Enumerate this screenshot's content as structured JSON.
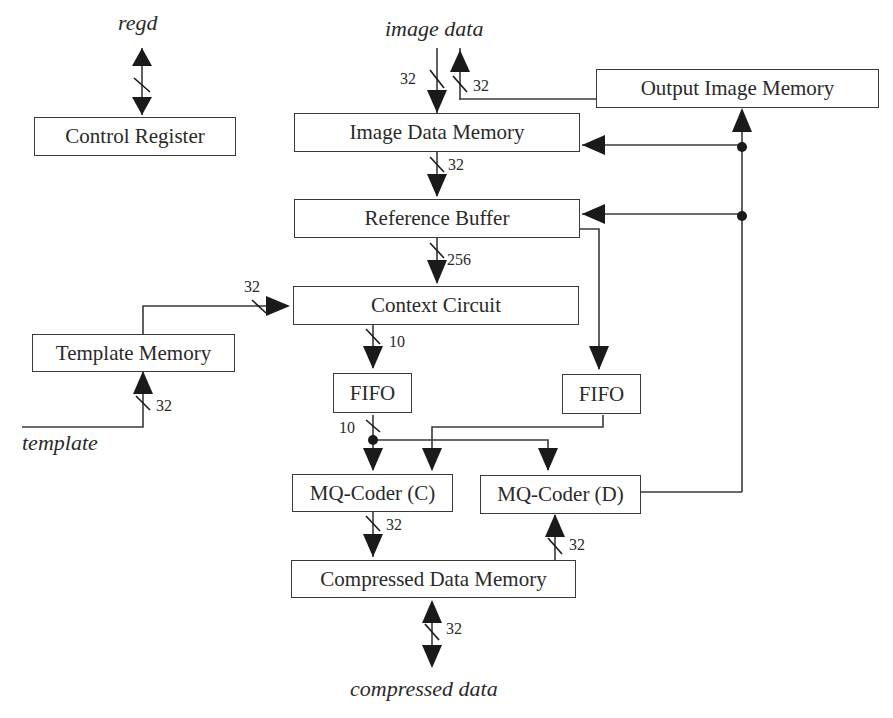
{
  "diagram": {
    "type": "block-diagram",
    "blocks": {
      "control_register": "Control Register",
      "image_data_memory": "Image Data Memory",
      "output_image_memory": "Output Image Memory",
      "reference_buffer": "Reference Buffer",
      "context_circuit": "Context Circuit",
      "template_memory": "Template Memory",
      "fifo_left": "FIFO",
      "fifo_right": "FIFO",
      "mq_coder_c": "MQ-Coder (C)",
      "mq_coder_d": "MQ-Coder (D)",
      "compressed_data_memory": "Compressed Data Memory"
    },
    "io": {
      "regd": "regd",
      "image_data": "image data",
      "template": "template",
      "compressed_data": "compressed data"
    },
    "bus_widths": {
      "image_in": "32",
      "image_out": "32",
      "idm_to_rb": "32",
      "rb_to_cc": "256",
      "tm_to_cc": "32",
      "cc_to_fifo": "10",
      "template_in": "32",
      "fifo_out": "10",
      "mqc_to_cdm": "32",
      "cdm_to_mqd": "32",
      "compressed_io": "32"
    },
    "connections": [
      {
        "from": "regd",
        "to": "Control Register",
        "bidirectional": true
      },
      {
        "from": "image data",
        "to": "Image Data Memory",
        "width": "32"
      },
      {
        "from": "Output Image Memory",
        "to": "image data",
        "width": "32"
      },
      {
        "from": "Image Data Memory",
        "to": "Reference Buffer",
        "width": "32"
      },
      {
        "from": "Reference Buffer",
        "to": "Context Circuit",
        "width": "256"
      },
      {
        "from": "Reference Buffer",
        "to": "FIFO (right)"
      },
      {
        "from": "Template Memory",
        "to": "Context Circuit",
        "width": "32"
      },
      {
        "from": "template",
        "to": "Template Memory",
        "width": "32"
      },
      {
        "from": "Context Circuit",
        "to": "FIFO (left)",
        "width": "10"
      },
      {
        "from": "FIFO (left)",
        "to": [
          "MQ-Coder (C)",
          "MQ-Coder (D)"
        ],
        "width": "10"
      },
      {
        "from": "FIFO (right)",
        "to": "MQ-Coder (C)"
      },
      {
        "from": "MQ-Coder (C)",
        "to": "Compressed Data Memory",
        "width": "32"
      },
      {
        "from": "Compressed Data Memory",
        "to": "MQ-Coder (D)",
        "width": "32"
      },
      {
        "from": "MQ-Coder (D)",
        "to": [
          "Output Image Memory",
          "Image Data Memory",
          "Reference Buffer"
        ]
      },
      {
        "from": "compressed data",
        "to": "Compressed Data Memory",
        "bidirectional": true,
        "width": "32"
      }
    ]
  }
}
